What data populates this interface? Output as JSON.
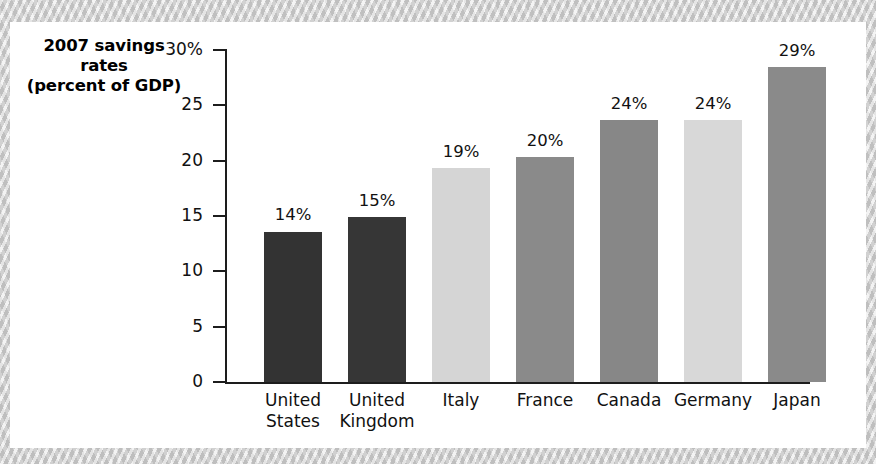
{
  "figure": {
    "title_lines": [
      "2007 savings",
      "rates",
      "(percent of GDP)"
    ],
    "background_color": "#ffffff",
    "page_border_color": "#cdcdcd"
  },
  "chart_data": {
    "type": "bar",
    "title": "2007 savings rates (percent of GDP)",
    "xlabel": "",
    "ylabel": "2007 savings rates (percent of GDP)",
    "ylim": [
      0,
      30
    ],
    "yticks": [
      0,
      5,
      10,
      15,
      20,
      25,
      30
    ],
    "ytick_labels": [
      "0",
      "5",
      "10",
      "15",
      "20",
      "25",
      "30%"
    ],
    "grid": false,
    "legend": "none",
    "categories": [
      "United States",
      "United Kingdom",
      "Italy",
      "France",
      "Canada",
      "Germany",
      "Japan"
    ],
    "category_lines": [
      [
        "United",
        "States"
      ],
      [
        "United",
        "Kingdom"
      ],
      [
        "Italy"
      ],
      [
        "France"
      ],
      [
        "Canada"
      ],
      [
        "Germany"
      ],
      [
        "Japan"
      ]
    ],
    "values": [
      14,
      15,
      19,
      20,
      24,
      24,
      29
    ],
    "plotted_values": [
      13.6,
      14.9,
      19.3,
      20.3,
      23.7,
      23.7,
      28.5
    ],
    "data_labels": [
      "14%",
      "15%",
      "19%",
      "20%",
      "24%",
      "24%",
      "29%"
    ],
    "bar_colors": [
      "#333333",
      "#363636",
      "#d5d5d5",
      "#8a8a8a",
      "#878787",
      "#d8d8d8",
      "#8a8a8a"
    ],
    "axis_color": "#1d1d1d"
  }
}
